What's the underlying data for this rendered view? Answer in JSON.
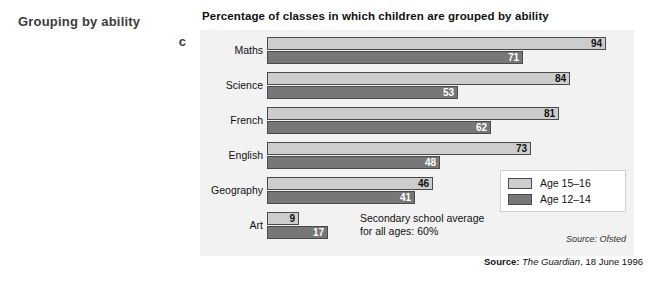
{
  "margin": {
    "heading": "Grouping by ability",
    "letter": "c"
  },
  "figure": {
    "title": "Percentage of classes in which children are grouped by ability",
    "annotation_line1": "Secondary school average",
    "annotation_line2": "for all ages: 60%",
    "chart_source": "Source: Ofsted"
  },
  "legend": {
    "items": [
      {
        "label": "Age 15–16",
        "color": "#cdcdcd"
      },
      {
        "label": "Age 12–14",
        "color": "#777777"
      }
    ]
  },
  "bottom_source": {
    "label": "Source:",
    "publication": "The Guardian",
    "date": ", 18 June 1996"
  },
  "chart_data": {
    "type": "bar",
    "orientation": "horizontal",
    "title": "Percentage of classes in which children are grouped by ability",
    "xlabel": "",
    "ylabel": "",
    "xlim": [
      0,
      100
    ],
    "grid": false,
    "legend_position": "inside-bottom-right",
    "categories": [
      "Maths",
      "Science",
      "French",
      "English",
      "Geography",
      "Art"
    ],
    "series": [
      {
        "name": "Age 15–16",
        "color": "#cdcdcd",
        "values": [
          94,
          84,
          81,
          73,
          46,
          9
        ]
      },
      {
        "name": "Age 12–14",
        "color": "#777777",
        "values": [
          71,
          53,
          62,
          48,
          41,
          17
        ]
      }
    ],
    "annotations": [
      "Secondary school average for all ages: 60%"
    ],
    "source": "Source: Ofsted"
  }
}
